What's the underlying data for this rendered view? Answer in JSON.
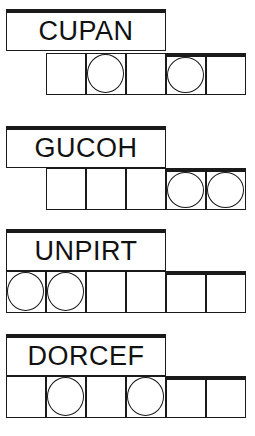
{
  "puzzles": [
    {
      "scrambled": "CUPAN",
      "cell_count": 5,
      "circled": [
        2,
        4
      ]
    },
    {
      "scrambled": "GUCOH",
      "cell_count": 5,
      "circled": [
        4,
        5
      ]
    },
    {
      "scrambled": "UNPIRT",
      "cell_count": 6,
      "circled": [
        1,
        2
      ]
    },
    {
      "scrambled": "DORCEF",
      "cell_count": 6,
      "circled": [
        2,
        4
      ]
    }
  ]
}
